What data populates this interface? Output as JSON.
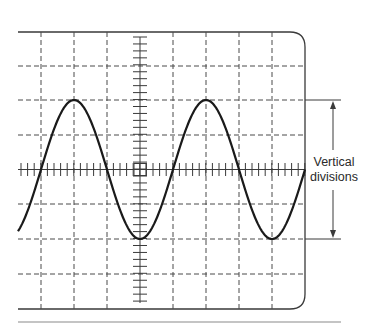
{
  "figure": {
    "annotation": {
      "line1": "Vertical",
      "line2": "divisions"
    }
  },
  "screen": {
    "grid_columns": 9,
    "grid_rows": 8,
    "line_color": "#3a3a3a",
    "wave_color": "#1a1a1a"
  },
  "waveform": {
    "type": "sine",
    "cycles_visible": 2.2,
    "peak_division": 2,
    "trough_division": -2,
    "peak_to_peak_divisions": 4
  }
}
